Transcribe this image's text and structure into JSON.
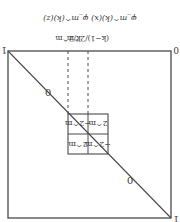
{
  "orientation": "rotated-180",
  "title": "φ_m^(k)(x) φ_m^(k)(z)",
  "top_labels": {
    "left": "k/2^m",
    "right": "(k−1)/2^m"
  },
  "corner_labels": {
    "top_left": "1",
    "top_right": "0",
    "bottom_right": "1"
  },
  "region_labels": {
    "upper": "0",
    "lower": "0"
  },
  "grid_cells": {
    "top_left": "−2^m",
    "top_right": "2^m",
    "bottom_left": "2^m",
    "bottom_right": "−2^m"
  },
  "colors": {
    "line": "#4a4a4a",
    "text": "#3a3a3a",
    "background": "#ffffff"
  }
}
